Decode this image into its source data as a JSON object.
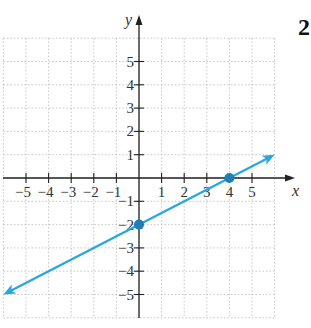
{
  "problem_number": "2",
  "chart_data": {
    "type": "line",
    "title": "",
    "xlabel": "x",
    "ylabel": "y",
    "xlim": [
      -6,
      6
    ],
    "ylim": [
      -6,
      6
    ],
    "grid": true,
    "x_ticks": [
      -5,
      -4,
      -3,
      -2,
      -1,
      1,
      2,
      3,
      4,
      5
    ],
    "y_ticks": [
      -5,
      -4,
      -3,
      -2,
      -1,
      1,
      2,
      3,
      4,
      5
    ],
    "x_tick_labels": [
      "−5",
      "−4",
      "−3",
      "−2",
      "−1",
      "1",
      "2",
      "3",
      "4",
      "5"
    ],
    "y_tick_labels": [
      "−5",
      "−4",
      "−3",
      "−2",
      "−1",
      "1",
      "2",
      "3",
      "4",
      "5"
    ],
    "series": [
      {
        "name": "line",
        "equation": "y = 0.5x - 2",
        "x": [
          -6,
          6
        ],
        "y": [
          -5,
          1
        ],
        "color": "#2aa6e0",
        "arrows": "both"
      }
    ],
    "points": [
      {
        "x": 0,
        "y": -2,
        "label": "y-intercept"
      },
      {
        "x": 4,
        "y": 0,
        "label": "x-intercept"
      }
    ]
  },
  "colors": {
    "line": "#2aa6e0",
    "point": "#1f7fb5",
    "axis": "#222222",
    "grid": "#b8b8b8"
  }
}
